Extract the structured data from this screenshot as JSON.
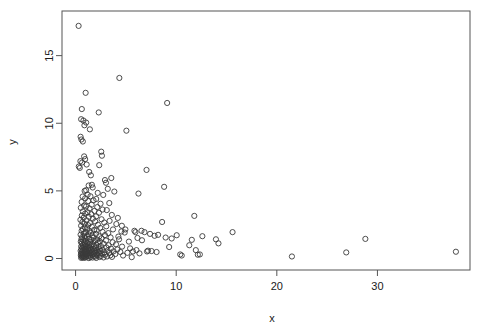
{
  "chart_data": {
    "type": "scatter",
    "title": "",
    "subtitle": "",
    "xlabel": "x",
    "ylabel": "y",
    "xlim": [
      -1.35,
      39.2
    ],
    "ylim": [
      -0.85,
      18.3
    ],
    "xticks": [
      0,
      10,
      20,
      30
    ],
    "yticks": [
      0,
      5,
      10,
      15
    ],
    "xtick_labels": [
      "0",
      "10",
      "20",
      "30"
    ],
    "ytick_labels": [
      "0",
      "5",
      "10",
      "15"
    ],
    "grid": false,
    "legend": null,
    "annotations": [],
    "marker": {
      "shape": "open-circle",
      "pch": 1,
      "radius_px": 2.6,
      "stroke": "#3a3a3a",
      "stroke_width": 0.9,
      "fill": "none"
    },
    "frame": {
      "box": true,
      "color": "#555555",
      "left_px": 62,
      "right_px": 470,
      "top_px": 11,
      "bottom_px": 270
    },
    "n_points": 520,
    "points": [
      [
        0.3,
        17.2
      ],
      [
        4.35,
        13.35
      ],
      [
        1.0,
        12.25
      ],
      [
        9.1,
        11.5
      ],
      [
        0.62,
        11.05
      ],
      [
        2.3,
        10.8
      ],
      [
        0.55,
        10.3
      ],
      [
        0.78,
        10.2
      ],
      [
        1.05,
        10.05
      ],
      [
        0.88,
        9.85
      ],
      [
        1.42,
        9.55
      ],
      [
        5.05,
        9.45
      ],
      [
        0.5,
        9.0
      ],
      [
        0.58,
        8.8
      ],
      [
        0.72,
        8.65
      ],
      [
        2.55,
        7.9
      ],
      [
        2.62,
        7.6
      ],
      [
        0.85,
        7.55
      ],
      [
        0.95,
        7.35
      ],
      [
        0.48,
        7.2
      ],
      [
        0.65,
        7.1
      ],
      [
        1.1,
        6.95
      ],
      [
        2.35,
        6.9
      ],
      [
        0.32,
        6.8
      ],
      [
        0.42,
        6.7
      ],
      [
        7.05,
        6.55
      ],
      [
        1.35,
        6.4
      ],
      [
        1.52,
        6.15
      ],
      [
        3.55,
        5.95
      ],
      [
        2.92,
        5.8
      ],
      [
        3.02,
        5.6
      ],
      [
        8.8,
        5.3
      ],
      [
        1.62,
        5.45
      ],
      [
        1.3,
        5.4
      ],
      [
        1.7,
        5.25
      ],
      [
        3.2,
        5.15
      ],
      [
        3.85,
        4.95
      ],
      [
        6.25,
        4.8
      ],
      [
        1.05,
        5.05
      ],
      [
        0.9,
        5.0
      ],
      [
        2.2,
        4.85
      ],
      [
        2.75,
        4.7
      ],
      [
        1.2,
        4.72
      ],
      [
        1.48,
        4.6
      ],
      [
        0.7,
        4.58
      ],
      [
        0.95,
        4.45
      ],
      [
        2.05,
        4.4
      ],
      [
        1.78,
        4.3
      ],
      [
        1.25,
        4.25
      ],
      [
        0.6,
        4.18
      ],
      [
        3.35,
        4.1
      ],
      [
        2.48,
        4.05
      ],
      [
        1.6,
        3.98
      ],
      [
        0.85,
        3.92
      ],
      [
        1.05,
        3.85
      ],
      [
        2.15,
        3.8
      ],
      [
        0.52,
        3.75
      ],
      [
        1.38,
        3.7
      ],
      [
        2.68,
        3.62
      ],
      [
        3.1,
        3.58
      ],
      [
        1.88,
        3.52
      ],
      [
        0.72,
        3.48
      ],
      [
        1.18,
        3.42
      ],
      [
        2.32,
        3.38
      ],
      [
        0.95,
        3.32
      ],
      [
        1.55,
        3.28
      ],
      [
        3.6,
        3.22
      ],
      [
        0.62,
        3.18
      ],
      [
        2.05,
        3.12
      ],
      [
        1.32,
        3.08
      ],
      [
        0.8,
        3.02
      ],
      [
        4.2,
        3.0
      ],
      [
        11.8,
        3.15
      ],
      [
        1.72,
        2.95
      ],
      [
        2.58,
        2.9
      ],
      [
        0.48,
        2.86
      ],
      [
        1.08,
        2.82
      ],
      [
        3.38,
        2.78
      ],
      [
        1.95,
        2.74
      ],
      [
        0.68,
        2.7
      ],
      [
        2.85,
        2.66
      ],
      [
        1.42,
        2.62
      ],
      [
        0.88,
        2.58
      ],
      [
        4.05,
        2.55
      ],
      [
        2.22,
        2.5
      ],
      [
        1.25,
        2.46
      ],
      [
        0.55,
        2.42
      ],
      [
        3.05,
        2.38
      ],
      [
        1.62,
        2.35
      ],
      [
        8.6,
        2.7
      ],
      [
        0.92,
        2.3
      ],
      [
        2.45,
        2.26
      ],
      [
        1.15,
        2.22
      ],
      [
        0.72,
        2.18
      ],
      [
        3.72,
        2.15
      ],
      [
        1.85,
        2.12
      ],
      [
        2.1,
        2.08
      ],
      [
        0.6,
        2.05
      ],
      [
        1.38,
        2.02
      ],
      [
        4.55,
        2.0
      ],
      [
        2.68,
        1.97
      ],
      [
        0.98,
        1.94
      ],
      [
        1.52,
        1.9
      ],
      [
        5.95,
        1.95
      ],
      [
        15.6,
        1.95
      ],
      [
        3.25,
        1.88
      ],
      [
        0.82,
        1.85
      ],
      [
        2.02,
        1.82
      ],
      [
        1.28,
        1.79
      ],
      [
        0.5,
        1.76
      ],
      [
        2.92,
        1.73
      ],
      [
        1.68,
        1.7
      ],
      [
        4.88,
        1.92
      ],
      [
        6.55,
        2.05
      ],
      [
        0.88,
        1.67
      ],
      [
        2.35,
        1.64
      ],
      [
        1.12,
        1.61
      ],
      [
        0.65,
        1.58
      ],
      [
        3.48,
        1.56
      ],
      [
        1.78,
        1.53
      ],
      [
        2.58,
        1.5
      ],
      [
        0.95,
        1.48
      ],
      [
        1.35,
        1.45
      ],
      [
        0.58,
        1.43
      ],
      [
        4.32,
        1.42
      ],
      [
        2.15,
        1.4
      ],
      [
        1.55,
        1.37
      ],
      [
        28.8,
        1.45
      ],
      [
        14.2,
        1.12
      ],
      [
        11.55,
        1.38
      ],
      [
        0.75,
        1.35
      ],
      [
        3.02,
        1.33
      ],
      [
        1.92,
        1.3
      ],
      [
        1.02,
        1.28
      ],
      [
        2.42,
        1.26
      ],
      [
        0.52,
        1.24
      ],
      [
        1.45,
        1.22
      ],
      [
        3.68,
        1.2
      ],
      [
        0.85,
        1.18
      ],
      [
        2.22,
        1.16
      ],
      [
        1.22,
        1.14
      ],
      [
        0.62,
        1.12
      ],
      [
        2.78,
        1.1
      ],
      [
        1.65,
        1.08
      ],
      [
        0.92,
        1.06
      ],
      [
        4.02,
        1.05
      ],
      [
        1.35,
        1.03
      ],
      [
        2.05,
        1.01
      ],
      [
        0.7,
        0.99
      ],
      [
        3.28,
        0.98
      ],
      [
        1.5,
        0.96
      ],
      [
        0.98,
        0.94
      ],
      [
        2.52,
        0.92
      ],
      [
        1.82,
        0.9
      ],
      [
        0.55,
        0.89
      ],
      [
        4.62,
        0.88
      ],
      [
        1.15,
        0.86
      ],
      [
        2.28,
        0.85
      ],
      [
        0.8,
        0.83
      ],
      [
        3.05,
        0.82
      ],
      [
        1.42,
        0.8
      ],
      [
        0.65,
        0.79
      ],
      [
        2.02,
        0.77
      ],
      [
        1.25,
        0.76
      ],
      [
        5.42,
        0.75
      ],
      [
        0.88,
        0.74
      ],
      [
        3.52,
        0.73
      ],
      [
        1.72,
        0.71
      ],
      [
        2.38,
        0.7
      ],
      [
        1.05,
        0.69
      ],
      [
        0.58,
        0.68
      ],
      [
        4.15,
        0.67
      ],
      [
        1.55,
        0.66
      ],
      [
        2.68,
        0.65
      ],
      [
        0.95,
        0.64
      ],
      [
        1.32,
        0.63
      ],
      [
        6.05,
        0.62
      ],
      [
        2.12,
        0.61
      ],
      [
        0.72,
        0.6
      ],
      [
        3.18,
        0.59
      ],
      [
        1.85,
        0.58
      ],
      [
        1.12,
        0.57
      ],
      [
        0.5,
        0.56
      ],
      [
        2.48,
        0.55
      ],
      [
        7.2,
        0.58
      ],
      [
        7.55,
        0.55
      ],
      [
        1.45,
        0.54
      ],
      [
        3.78,
        0.53
      ],
      [
        0.85,
        0.52
      ],
      [
        2.22,
        0.51
      ],
      [
        1.62,
        0.5
      ],
      [
        1.02,
        0.49
      ],
      [
        4.45,
        0.48
      ],
      [
        0.62,
        0.47
      ],
      [
        2.85,
        0.46
      ],
      [
        1.28,
        0.45
      ],
      [
        1.95,
        0.44
      ],
      [
        0.92,
        0.43
      ],
      [
        5.15,
        0.42
      ],
      [
        3.35,
        0.41
      ],
      [
        1.52,
        0.4
      ],
      [
        2.32,
        0.39
      ],
      [
        0.75,
        0.38
      ],
      [
        1.18,
        0.37
      ],
      [
        0.55,
        0.36
      ],
      [
        2.62,
        0.35
      ],
      [
        1.78,
        0.34
      ],
      [
        3.95,
        0.33
      ],
      [
        0.98,
        0.32
      ],
      [
        1.38,
        0.31
      ],
      [
        2.08,
        0.3
      ],
      [
        6.35,
        0.38
      ],
      [
        0.68,
        0.29
      ],
      [
        2.92,
        0.28
      ],
      [
        1.62,
        0.27
      ],
      [
        1.08,
        0.26
      ],
      [
        0.52,
        0.25
      ],
      [
        3.45,
        0.24
      ],
      [
        2.18,
        0.23
      ],
      [
        1.42,
        0.22
      ],
      [
        0.88,
        0.21
      ],
      [
        1.85,
        0.2
      ],
      [
        4.72,
        0.22
      ],
      [
        0.72,
        0.19
      ],
      [
        2.52,
        0.18
      ],
      [
        1.25,
        0.17
      ],
      [
        0.6,
        0.16
      ],
      [
        3.12,
        0.15
      ],
      [
        1.95,
        0.14
      ],
      [
        1.05,
        0.13
      ],
      [
        0.82,
        0.12
      ],
      [
        2.38,
        0.11
      ],
      [
        1.48,
        0.1
      ],
      [
        0.65,
        0.09
      ],
      [
        2.78,
        0.08
      ],
      [
        1.68,
        0.07
      ],
      [
        0.95,
        0.06
      ],
      [
        0.55,
        0.05
      ],
      [
        3.62,
        0.12
      ],
      [
        2.05,
        0.04
      ],
      [
        1.32,
        0.03
      ],
      [
        0.78,
        0.05
      ],
      [
        5.58,
        0.1
      ],
      [
        21.5,
        0.15
      ],
      [
        26.9,
        0.45
      ],
      [
        37.8,
        0.5
      ],
      [
        10.4,
        0.3
      ],
      [
        10.55,
        0.22
      ],
      [
        12.15,
        0.28
      ],
      [
        9.3,
        0.85
      ],
      [
        8.95,
        1.55
      ],
      [
        9.55,
        1.48
      ],
      [
        10.05,
        1.72
      ],
      [
        11.3,
        0.98
      ],
      [
        11.95,
        0.62
      ],
      [
        12.35,
        0.3
      ],
      [
        13.95,
        1.42
      ],
      [
        8.2,
        1.75
      ],
      [
        7.85,
        1.68
      ],
      [
        7.4,
        1.82
      ],
      [
        6.85,
        1.95
      ],
      [
        6.15,
        1.52
      ],
      [
        5.7,
        0.52
      ],
      [
        5.3,
        1.25
      ],
      [
        4.95,
        2.15
      ],
      [
        4.6,
        2.42
      ],
      [
        4.25,
        1.62
      ],
      [
        5.85,
        2.05
      ],
      [
        6.6,
        1.35
      ],
      [
        7.1,
        0.52
      ],
      [
        8.05,
        0.48
      ],
      [
        12.6,
        1.65
      ]
    ]
  }
}
